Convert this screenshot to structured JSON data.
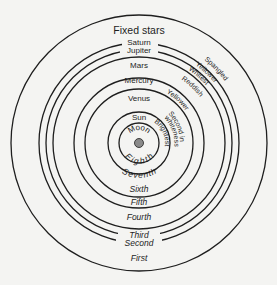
{
  "diagram": {
    "center_dot_color": "#8a8a8a",
    "line_color": "#1e1e1e",
    "background": "#f4f4f2",
    "spheres": [
      {
        "body": "Fixed stars",
        "ordinal": "First",
        "color": "Spangled"
      },
      {
        "body": "Saturn",
        "ordinal": "Second",
        "color": "Yellower"
      },
      {
        "body": "Jupiter",
        "ordinal": "Third",
        "color": "Whitest"
      },
      {
        "body": "Mars",
        "ordinal": "Fourth",
        "color": "Reddish"
      },
      {
        "body": "Mercury",
        "ordinal": "Fifth",
        "color": "Yellower"
      },
      {
        "body": "Venus",
        "ordinal": "Sixth",
        "color": "Second in whiteness"
      },
      {
        "body": "Sun",
        "ordinal": "Seventh",
        "color": "Brightest"
      },
      {
        "body": "Moon",
        "ordinal": "Eighth",
        "color": ""
      }
    ],
    "labels": {
      "fixed_stars": "Fixed stars",
      "saturn": "Saturn",
      "jupiter": "Jupiter",
      "mars": "Mars",
      "mercury": "Mercury",
      "venus": "Venus",
      "sun": "Sun",
      "moon": "Moon",
      "first": "First",
      "second": "Second",
      "third": "Third",
      "fourth": "Fourth",
      "fifth": "Fifth",
      "sixth": "Sixth",
      "seventh": "Seventh",
      "eighth": "Eighth",
      "spangled": "Spangled",
      "yellower_1": "Yellower",
      "whitest": "Whitest",
      "reddish": "Reddish",
      "yellower_2": "Yellower",
      "second_in": "Second in",
      "whiteness": "whiteness",
      "brightest": "Brightest"
    }
  }
}
